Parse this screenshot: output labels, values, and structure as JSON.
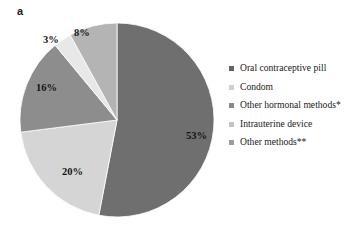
{
  "figure": {
    "panel_label": "a",
    "background": "#ffffff"
  },
  "chart_data": {
    "type": "pie",
    "title": "",
    "xlabel": "",
    "ylabel": "",
    "grid": false,
    "legend_position": "right",
    "start_angle_deg": 0,
    "direction": "clockwise",
    "units": "percent",
    "total": 100,
    "categories": [
      "Oral contraceptive pill",
      "Condom",
      "Other hormonal methods*",
      "Intrauterine device",
      "Other methods**"
    ],
    "values": [
      53,
      20,
      16,
      3,
      8
    ],
    "data_labels": [
      "53%",
      "20%",
      "16%",
      "3%",
      "8%"
    ],
    "colors": [
      "#6f6f6f",
      "#d5d5d5",
      "#8d8d8d",
      "#e8e8e8",
      "#b4b4b4"
    ],
    "slices": [
      {
        "label": "Oral contraceptive pill",
        "value": 53,
        "data_label": "53%",
        "color": "#6f6f6f"
      },
      {
        "label": "Condom",
        "value": 20,
        "data_label": "20%",
        "color": "#d5d5d5"
      },
      {
        "label": "Other hormonal methods*",
        "value": 16,
        "data_label": "16%",
        "color": "#8d8d8d"
      },
      {
        "label": "Intrauterine device",
        "value": 3,
        "data_label": "3%",
        "color": "#e8e8e8"
      },
      {
        "label": "Other methods**",
        "value": 8,
        "data_label": "8%",
        "color": "#b4b4b4"
      }
    ]
  },
  "legend": {
    "items": [
      {
        "label": "Oral contraceptive pill",
        "color": "#636363"
      },
      {
        "label": "Condom",
        "color": "#cfcfcf"
      },
      {
        "label": "Other hormonal methods*",
        "color": "#8a8a8a"
      },
      {
        "label": "Intrauterine device",
        "color": "#c4c4c4"
      },
      {
        "label": "Other methods**",
        "color": "#9c9c9c"
      }
    ]
  }
}
